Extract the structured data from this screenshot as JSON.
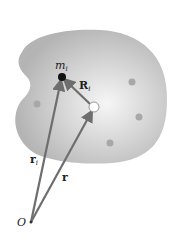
{
  "diagram": {
    "labels": {
      "mass": "m",
      "mass_sub": "i",
      "rel_vector": "R",
      "rel_vector_sub": "i",
      "pos_i": "r",
      "pos_i_sub": "i",
      "pos_cm": "r",
      "origin": "O"
    },
    "points": {
      "origin": [
        31,
        222
      ],
      "mass_i": [
        62,
        77
      ],
      "center_of_mass": [
        94,
        107
      ]
    },
    "other_particles": [
      [
        37,
        104
      ],
      [
        132,
        82
      ],
      [
        139,
        117
      ],
      [
        110,
        143
      ]
    ],
    "colors": {
      "body_fill": "#c4c4c4",
      "body_highlight": "#f4f4f4",
      "vector": "#6e6e6e",
      "particle": "#9a9a9a",
      "mass_dot": "#111111"
    }
  }
}
